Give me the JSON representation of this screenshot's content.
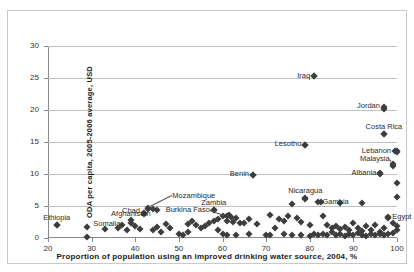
{
  "figure": {
    "title_remnant": "· · ·",
    "border_color": "#c9c9c9",
    "marker_color": "#3d3d3d",
    "grid_color": "#c0c0c0",
    "axis_color": "#8a8a8a"
  },
  "chart_data": {
    "type": "scatter",
    "title": "",
    "xlabel": "Proportion of population using an improved drinking water source, 2004,  %",
    "ylabel": "ODA per capita, 2005-2006 average, USD",
    "xlim": [
      20,
      100
    ],
    "ylim": [
      0,
      30
    ],
    "xticks": [
      20,
      30,
      40,
      50,
      60,
      70,
      80,
      90,
      100
    ],
    "yticks": [
      0,
      5,
      10,
      15,
      20,
      25,
      30
    ],
    "grid": "horizontal",
    "legend": "none",
    "annotations": [
      {
        "label": "Iraq",
        "x": 81,
        "y": 25.3,
        "anchor": "right",
        "dx": -4,
        "dy": 0
      },
      {
        "label": "Jordan",
        "x": 97,
        "y": 20.4,
        "anchor": "right",
        "dx": -4,
        "dy": -1
      },
      {
        "label": "Costa Rica",
        "x": 97,
        "y": 16.3,
        "anchor": "center",
        "dx": 0,
        "dy": -7
      },
      {
        "label": "Lesotho",
        "x": 79,
        "y": 14.6,
        "anchor": "right",
        "dx": -4,
        "dy": -1
      },
      {
        "label": "Lebanon",
        "x": 100,
        "y": 13.6,
        "anchor": "right",
        "dx": -6,
        "dy": 0
      },
      {
        "label": "Malaysia",
        "x": 99,
        "y": 11.5,
        "anchor": "right",
        "dx": -3,
        "dy": -5
      },
      {
        "label": "Albania",
        "x": 96,
        "y": 10.1,
        "anchor": "right",
        "dx": -3,
        "dy": 0
      },
      {
        "label": "Benin",
        "x": 67,
        "y": 9.9,
        "anchor": "right",
        "dx": -4,
        "dy": -1
      },
      {
        "label": "Nicaragua",
        "x": 79,
        "y": 6.3,
        "anchor": "center",
        "dx": 0,
        "dy": -7
      },
      {
        "label": "Gambia",
        "x": 82,
        "y": 5.6,
        "anchor": "left",
        "dx": 4,
        "dy": 0
      },
      {
        "label": "Mozambique",
        "x": 43,
        "y": 4.7,
        "anchor": "left",
        "dx": 24,
        "dy": -12
      },
      {
        "label": "Zambia",
        "x": 58,
        "y": 4.4,
        "anchor": "center",
        "dx": 0,
        "dy": -7
      },
      {
        "label": "Burkina Faso",
        "x": 61,
        "y": 3.5,
        "anchor": "right",
        "dx": -17,
        "dy": -6
      },
      {
        "label": "Chad",
        "x": 42,
        "y": 3.9,
        "anchor": "right",
        "dx": -4,
        "dy": -2
      },
      {
        "label": "Afghanistan",
        "x": 39,
        "y": 2.8,
        "anchor": "center",
        "dx": 0,
        "dy": -6
      },
      {
        "label": "Somalia",
        "x": 29,
        "y": 1.7,
        "anchor": "left",
        "dx": 6,
        "dy": -3
      },
      {
        "label": "Ethiopia",
        "x": 22,
        "y": 2.1,
        "anchor": "center",
        "dx": 0,
        "dy": -7
      },
      {
        "label": "Egypt",
        "x": 98,
        "y": 3.3,
        "anchor": "left",
        "dx": 4,
        "dy": 0
      }
    ],
    "points": [
      {
        "x": 81,
        "y": 25.3
      },
      {
        "x": 97,
        "y": 20.2
      },
      {
        "x": 97,
        "y": 16.2
      },
      {
        "x": 79,
        "y": 14.5
      },
      {
        "x": 99.5,
        "y": 13.6
      },
      {
        "x": 100,
        "y": 13.4
      },
      {
        "x": 99,
        "y": 11.3
      },
      {
        "x": 96,
        "y": 10.0
      },
      {
        "x": 67,
        "y": 9.8
      },
      {
        "x": 100,
        "y": 8.6
      },
      {
        "x": 100,
        "y": 6.4
      },
      {
        "x": 79,
        "y": 6.1
      },
      {
        "x": 82.5,
        "y": 5.6
      },
      {
        "x": 76,
        "y": 5.3
      },
      {
        "x": 87,
        "y": 5.5
      },
      {
        "x": 92,
        "y": 5.4
      },
      {
        "x": 58,
        "y": 4.4
      },
      {
        "x": 43,
        "y": 4.6
      },
      {
        "x": 44,
        "y": 4.5
      },
      {
        "x": 45,
        "y": 4.4
      },
      {
        "x": 42,
        "y": 3.8
      },
      {
        "x": 61.5,
        "y": 3.6
      },
      {
        "x": 62,
        "y": 3.3
      },
      {
        "x": 63,
        "y": 3.1
      },
      {
        "x": 60,
        "y": 3.4
      },
      {
        "x": 59,
        "y": 3.0
      },
      {
        "x": 61,
        "y": 2.7
      },
      {
        "x": 62.5,
        "y": 2.5
      },
      {
        "x": 64,
        "y": 2.4
      },
      {
        "x": 66,
        "y": 2.9
      },
      {
        "x": 68,
        "y": 2.2
      },
      {
        "x": 71,
        "y": 3.6
      },
      {
        "x": 73,
        "y": 3.0
      },
      {
        "x": 74,
        "y": 2.6
      },
      {
        "x": 75,
        "y": 3.4
      },
      {
        "x": 77,
        "y": 3.2
      },
      {
        "x": 78,
        "y": 2.5
      },
      {
        "x": 80,
        "y": 2.1
      },
      {
        "x": 83,
        "y": 3.4
      },
      {
        "x": 84,
        "y": 2.0
      },
      {
        "x": 85,
        "y": 1.6
      },
      {
        "x": 86,
        "y": 1.9
      },
      {
        "x": 87,
        "y": 1.4
      },
      {
        "x": 88,
        "y": 1.7
      },
      {
        "x": 89,
        "y": 1.2
      },
      {
        "x": 90,
        "y": 2.3
      },
      {
        "x": 91,
        "y": 1.5
      },
      {
        "x": 92,
        "y": 1.1
      },
      {
        "x": 93,
        "y": 1.8
      },
      {
        "x": 94,
        "y": 1.3
      },
      {
        "x": 95,
        "y": 2.0
      },
      {
        "x": 96,
        "y": 1.0
      },
      {
        "x": 97,
        "y": 1.6
      },
      {
        "x": 98,
        "y": 3.2
      },
      {
        "x": 99,
        "y": 2.4
      },
      {
        "x": 100,
        "y": 1.9
      },
      {
        "x": 100,
        "y": 1.2
      },
      {
        "x": 99,
        "y": 0.8
      },
      {
        "x": 98,
        "y": 0.6
      },
      {
        "x": 97,
        "y": 0.5
      },
      {
        "x": 96,
        "y": 0.7
      },
      {
        "x": 95,
        "y": 0.4
      },
      {
        "x": 94,
        "y": 0.6
      },
      {
        "x": 93,
        "y": 0.3
      },
      {
        "x": 92,
        "y": 0.5
      },
      {
        "x": 91,
        "y": 0.8
      },
      {
        "x": 90,
        "y": 0.4
      },
      {
        "x": 89,
        "y": 0.6
      },
      {
        "x": 88,
        "y": 0.3
      },
      {
        "x": 87,
        "y": 0.7
      },
      {
        "x": 86,
        "y": 0.4
      },
      {
        "x": 85,
        "y": 0.9
      },
      {
        "x": 84,
        "y": 0.5
      },
      {
        "x": 83,
        "y": 0.7
      },
      {
        "x": 82,
        "y": 0.4
      },
      {
        "x": 81,
        "y": 0.6
      },
      {
        "x": 80,
        "y": 0.3
      },
      {
        "x": 78,
        "y": 0.5
      },
      {
        "x": 76,
        "y": 0.4
      },
      {
        "x": 74,
        "y": 0.7
      },
      {
        "x": 72,
        "y": 1.6
      },
      {
        "x": 71,
        "y": 0.5
      },
      {
        "x": 70,
        "y": 0.4
      },
      {
        "x": 66,
        "y": 0.6
      },
      {
        "x": 65,
        "y": 2.3
      },
      {
        "x": 63,
        "y": 0.5
      },
      {
        "x": 61,
        "y": 0.4
      },
      {
        "x": 60,
        "y": 0.7
      },
      {
        "x": 59,
        "y": 1.2
      },
      {
        "x": 58,
        "y": 2.7
      },
      {
        "x": 57,
        "y": 2.3
      },
      {
        "x": 56,
        "y": 1.9
      },
      {
        "x": 55,
        "y": 1.5
      },
      {
        "x": 54,
        "y": 2.0
      },
      {
        "x": 53,
        "y": 2.6
      },
      {
        "x": 52,
        "y": 2.2
      },
      {
        "x": 52,
        "y": 1.0
      },
      {
        "x": 51,
        "y": 0.5
      },
      {
        "x": 50,
        "y": 0.7
      },
      {
        "x": 48,
        "y": 1.6
      },
      {
        "x": 47,
        "y": 2.2
      },
      {
        "x": 46,
        "y": 1.0
      },
      {
        "x": 45,
        "y": 1.7
      },
      {
        "x": 44,
        "y": 1.2
      },
      {
        "x": 41,
        "y": 1.4
      },
      {
        "x": 40,
        "y": 1.9
      },
      {
        "x": 39,
        "y": 2.4
      },
      {
        "x": 38,
        "y": 1.3
      },
      {
        "x": 37,
        "y": 2.0
      },
      {
        "x": 36,
        "y": 1.5
      },
      {
        "x": 33,
        "y": 1.4
      },
      {
        "x": 29,
        "y": 0.1
      },
      {
        "x": 22,
        "y": 2.0
      }
    ]
  }
}
